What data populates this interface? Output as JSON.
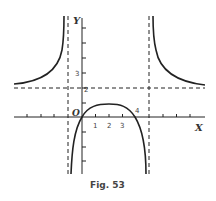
{
  "figure": {
    "caption": "Fig. 53",
    "axis_x_label": "X",
    "axis_y_label": "Y",
    "origin_label": "O",
    "tick_labels_x": [
      "1",
      "2",
      "3",
      "4"
    ],
    "tick_labels_y": [
      "2",
      "3"
    ],
    "asymptotes": {
      "vertical": [
        -1,
        5
      ],
      "horizontal": [
        2
      ]
    },
    "colors": {
      "ink": "#222222",
      "background": "#ffffff"
    }
  }
}
